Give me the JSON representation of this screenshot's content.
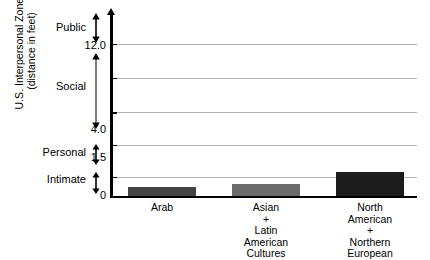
{
  "chart_data": {
    "type": "bar",
    "title": "",
    "subtitle": "",
    "xlabel": "",
    "ylabel_lines": [
      "U.S. Interpersonal Zones",
      "(distance in feet)"
    ],
    "categories": [
      "Arab",
      "Asian + Latin American Cultures",
      "North American + Northern European"
    ],
    "category_label_lines": [
      [
        "Arab"
      ],
      [
        "Asian",
        "+",
        "Latin",
        "American",
        "Cultures"
      ],
      [
        "North",
        "American",
        "+",
        "Northern",
        "European"
      ]
    ],
    "values": [
      0.7,
      0.95,
      1.85
    ],
    "bar_colors": [
      "#444444",
      "#6b6b6b",
      "#1c1c1c"
    ],
    "ylim": [
      0,
      14.5
    ],
    "ytick_values": [
      "0",
      "1.5",
      "4.0",
      "12.0"
    ],
    "ytick_positions": [
      0,
      1.5,
      4.0,
      12.0
    ],
    "gridline_positions": [
      1.5,
      4.0,
      6.6,
      9.3,
      12.0
    ],
    "grid": true,
    "legend": "none",
    "zones": [
      {
        "name": "Intimate",
        "from": "0",
        "to": "1.5"
      },
      {
        "name": "Personal",
        "from": "1.5",
        "to": "4.0"
      },
      {
        "name": "Social",
        "from": "4.0",
        "to": "12.0"
      },
      {
        "name": "Public",
        "from": "12.0",
        "to": ""
      }
    ],
    "grid_color": "#b0b0b0",
    "axis_color": "#000000"
  }
}
